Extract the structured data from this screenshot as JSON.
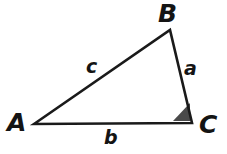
{
  "figure": {
    "kind": "geometry-diagram",
    "shape": "triangle",
    "background_color": "#ffffff",
    "stroke_color": "#1a1a1a",
    "stroke_width": 2.6,
    "angle_marker_fill": "#4a4a4a",
    "canvas": {
      "width": 227,
      "height": 154
    }
  },
  "vertices": [
    {
      "id": "A",
      "label": "A",
      "x": 34,
      "y": 124
    },
    {
      "id": "B",
      "label": "B",
      "x": 170,
      "y": 30
    },
    {
      "id": "C",
      "label": "C",
      "x": 192,
      "y": 123
    }
  ],
  "sides": [
    {
      "id": "a",
      "label": "a",
      "between": "B-C"
    },
    {
      "id": "b",
      "label": "b",
      "between": "A-C"
    },
    {
      "id": "c",
      "label": "c",
      "between": "A-B"
    }
  ],
  "angle_marker": {
    "at_vertex": "C",
    "style": "filled-wedge",
    "fill": "#4a4a4a",
    "points": "173,121 190,121 190,103"
  },
  "geometry": {
    "triangle_points": "34,124 170,30 192,123"
  }
}
